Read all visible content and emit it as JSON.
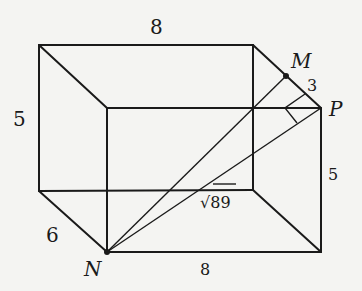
{
  "diagram": {
    "type": "rectangular prism (box) with diagonals",
    "points": {
      "M": {
        "label": "M"
      },
      "N": {
        "label": "N"
      },
      "P": {
        "label": "P"
      }
    },
    "edge_labels": {
      "top_length": "8",
      "bottom_length": "8",
      "left_height": "5",
      "right_height": "5",
      "depth": "6",
      "mp_segment": "3",
      "np_diagonal": "√89"
    },
    "colors": {
      "line": "#1a1a1a",
      "background": "#f4f4f2"
    }
  }
}
